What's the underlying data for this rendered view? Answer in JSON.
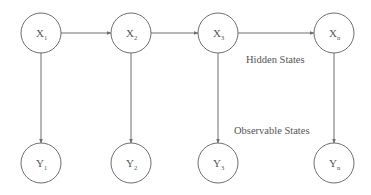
{
  "diagram": {
    "hidden_nodes": [
      {
        "id": "x1",
        "letter": "X",
        "sub": "1",
        "cx": 41,
        "cy": 33
      },
      {
        "id": "x2",
        "letter": "X",
        "sub": "2",
        "cx": 131,
        "cy": 33
      },
      {
        "id": "x3",
        "letter": "X",
        "sub": "3",
        "cx": 218,
        "cy": 33
      },
      {
        "id": "xn",
        "letter": "X",
        "sub": "n",
        "cx": 334,
        "cy": 33
      }
    ],
    "observable_nodes": [
      {
        "id": "y1",
        "letter": "Y",
        "sub": "1",
        "cx": 41,
        "cy": 163
      },
      {
        "id": "y2",
        "letter": "Y",
        "sub": "2",
        "cx": 131,
        "cy": 163
      },
      {
        "id": "y3",
        "letter": "Y",
        "sub": "3",
        "cx": 218,
        "cy": 163
      },
      {
        "id": "yn",
        "letter": "Y",
        "sub": "n",
        "cx": 334,
        "cy": 163
      }
    ],
    "radius": 20,
    "labels": {
      "hidden": "Hidden States",
      "observable": "Observable States"
    },
    "colors": {
      "stroke": "#6e6e6e",
      "text": "#555555"
    }
  }
}
